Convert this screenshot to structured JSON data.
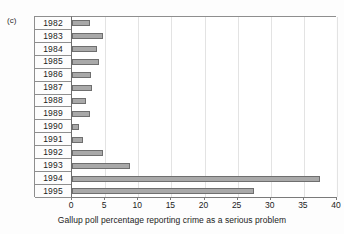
{
  "figure": {
    "panel_label": "(c)"
  },
  "chart_data": {
    "type": "bar",
    "orientation": "horizontal",
    "title": "",
    "xlabel": "Gallup poll percentage reporting crime as a serious problem",
    "ylabel": "",
    "categories": [
      "1982",
      "1983",
      "1984",
      "1985",
      "1986",
      "1987",
      "1988",
      "1989",
      "1990",
      "1991",
      "1992",
      "1993",
      "1994",
      "1995"
    ],
    "values": [
      2.7,
      4.7,
      3.8,
      4.1,
      2.9,
      3.0,
      2.1,
      2.7,
      1.0,
      1.6,
      4.7,
      8.8,
      37.5,
      27.5
    ],
    "xlim": [
      0,
      40
    ],
    "xticks": [
      0,
      5,
      10,
      15,
      20,
      25,
      30,
      35,
      40
    ],
    "xtick_labels": [
      "0",
      "5",
      "10",
      "15",
      "20",
      "25",
      "30",
      "35",
      "40"
    ],
    "grid": "vertical",
    "legend": null,
    "bar_color": "#a9a9a9",
    "bar_edge_color": "#6f6f6f"
  }
}
